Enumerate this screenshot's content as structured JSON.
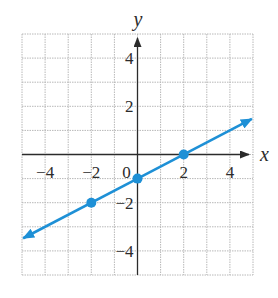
{
  "chart_data": {
    "type": "line",
    "title": "",
    "xlabel": "x",
    "ylabel": "y",
    "xlim": [
      -5,
      5
    ],
    "ylim": [
      -5,
      5
    ],
    "grid": true,
    "x_ticks": [
      -4,
      -2,
      0,
      2,
      4
    ],
    "y_ticks": [
      4,
      2,
      -2,
      -4
    ],
    "x_tick_labels": [
      "−4",
      "−2",
      "0",
      "2",
      "4"
    ],
    "y_tick_labels": [
      "4",
      "2",
      "−2",
      "−4"
    ],
    "series": [
      {
        "name": "line",
        "equation": "y = x/2 - 1",
        "slope": 0.5,
        "intercept": -1,
        "x_range": [
          -5,
          5
        ],
        "color": "#1e90d6",
        "arrows": "both"
      }
    ],
    "points": [
      {
        "x": -2,
        "y": -2
      },
      {
        "x": 0,
        "y": -1
      },
      {
        "x": 2,
        "y": 0
      }
    ]
  },
  "colors": {
    "line": "#1e90d6",
    "axis": "#2b2b2b",
    "grid": "#b8b8b8"
  }
}
